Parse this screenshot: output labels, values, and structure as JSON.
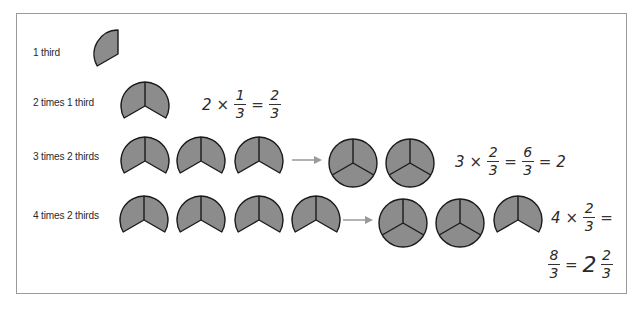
{
  "diagram": {
    "colors": {
      "fill": "#8c8c8c",
      "stroke": "#1a1a1a",
      "arrow": "#9a9a9a",
      "border": "#9a9a9a"
    },
    "rows": [
      {
        "label": "1 third",
        "pieces": [
          "one-third"
        ],
        "result": [],
        "equation": null
      },
      {
        "label": "2 times 1 third",
        "pieces": [
          "two-thirds"
        ],
        "result": [],
        "equation": {
          "lhs_whole": "2",
          "times": "×",
          "frac1_num": "1",
          "frac1_den": "3",
          "eq": "=",
          "frac2_num": "2",
          "frac2_den": "3"
        }
      },
      {
        "label": "3 times 2 thirds",
        "pieces": [
          "two-thirds",
          "two-thirds",
          "two-thirds"
        ],
        "result": [
          "whole",
          "whole"
        ],
        "equation": {
          "lhs_whole": "3",
          "times": "×",
          "frac1_num": "2",
          "frac1_den": "3",
          "eq": "=",
          "frac2_num": "6",
          "frac2_den": "3",
          "eq2": "=",
          "result": "2"
        }
      },
      {
        "label": "4 times 2 thirds",
        "pieces": [
          "two-thirds",
          "two-thirds",
          "two-thirds",
          "two-thirds"
        ],
        "result": [
          "whole",
          "whole",
          "two-thirds"
        ],
        "equation": {
          "lhs_whole": "4",
          "times": "×",
          "frac1_num": "2",
          "frac1_den": "3",
          "eq": "=",
          "frac2_num": "8",
          "frac2_den": "3",
          "eq2": "=",
          "mixed_whole": "2",
          "mixed_num": "2",
          "mixed_den": "3"
        }
      }
    ]
  }
}
